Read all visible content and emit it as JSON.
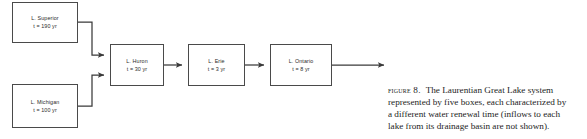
{
  "figure": {
    "number_label": "FIGURE 8.",
    "caption_lines": [
      "The Laurentian Great Lake system",
      "represented by five boxes, each characterized by",
      "a different water renewal time (inflows to each",
      "lake from its drainage basin are not shown)."
    ],
    "caption_full": "FIGURE 8. The Laurentian Great Lake system represented by five boxes, each characterized by a different water renewal time (inflows to each lake from its drainage basin are not shown)."
  },
  "diagram": {
    "type": "flowchart",
    "box_stroke_color": "#4a4a4a",
    "arrow_color": "#3a3a3a",
    "background_color": "#ffffff",
    "nodes": [
      {
        "id": "superior",
        "name": "L. Superior",
        "time": "t = 190 yr",
        "renewal_time_years": 190
      },
      {
        "id": "michigan",
        "name": "L. Michigan",
        "time": "t = 100 yr",
        "renewal_time_years": 100
      },
      {
        "id": "huron",
        "name": "L. Huron",
        "time": "t = 30 yr",
        "renewal_time_years": 30
      },
      {
        "id": "erie",
        "name": "L. Erie",
        "time": "t = 3 yr",
        "renewal_time_years": 3
      },
      {
        "id": "ontario",
        "name": "L. Ontario",
        "time": "t = 8 yr",
        "renewal_time_years": 8
      }
    ],
    "edges": [
      {
        "from": "superior",
        "to": "huron"
      },
      {
        "from": "michigan",
        "to": "huron"
      },
      {
        "from": "huron",
        "to": "erie"
      },
      {
        "from": "erie",
        "to": "ontario"
      },
      {
        "from": "ontario",
        "to": "outflow"
      }
    ]
  }
}
